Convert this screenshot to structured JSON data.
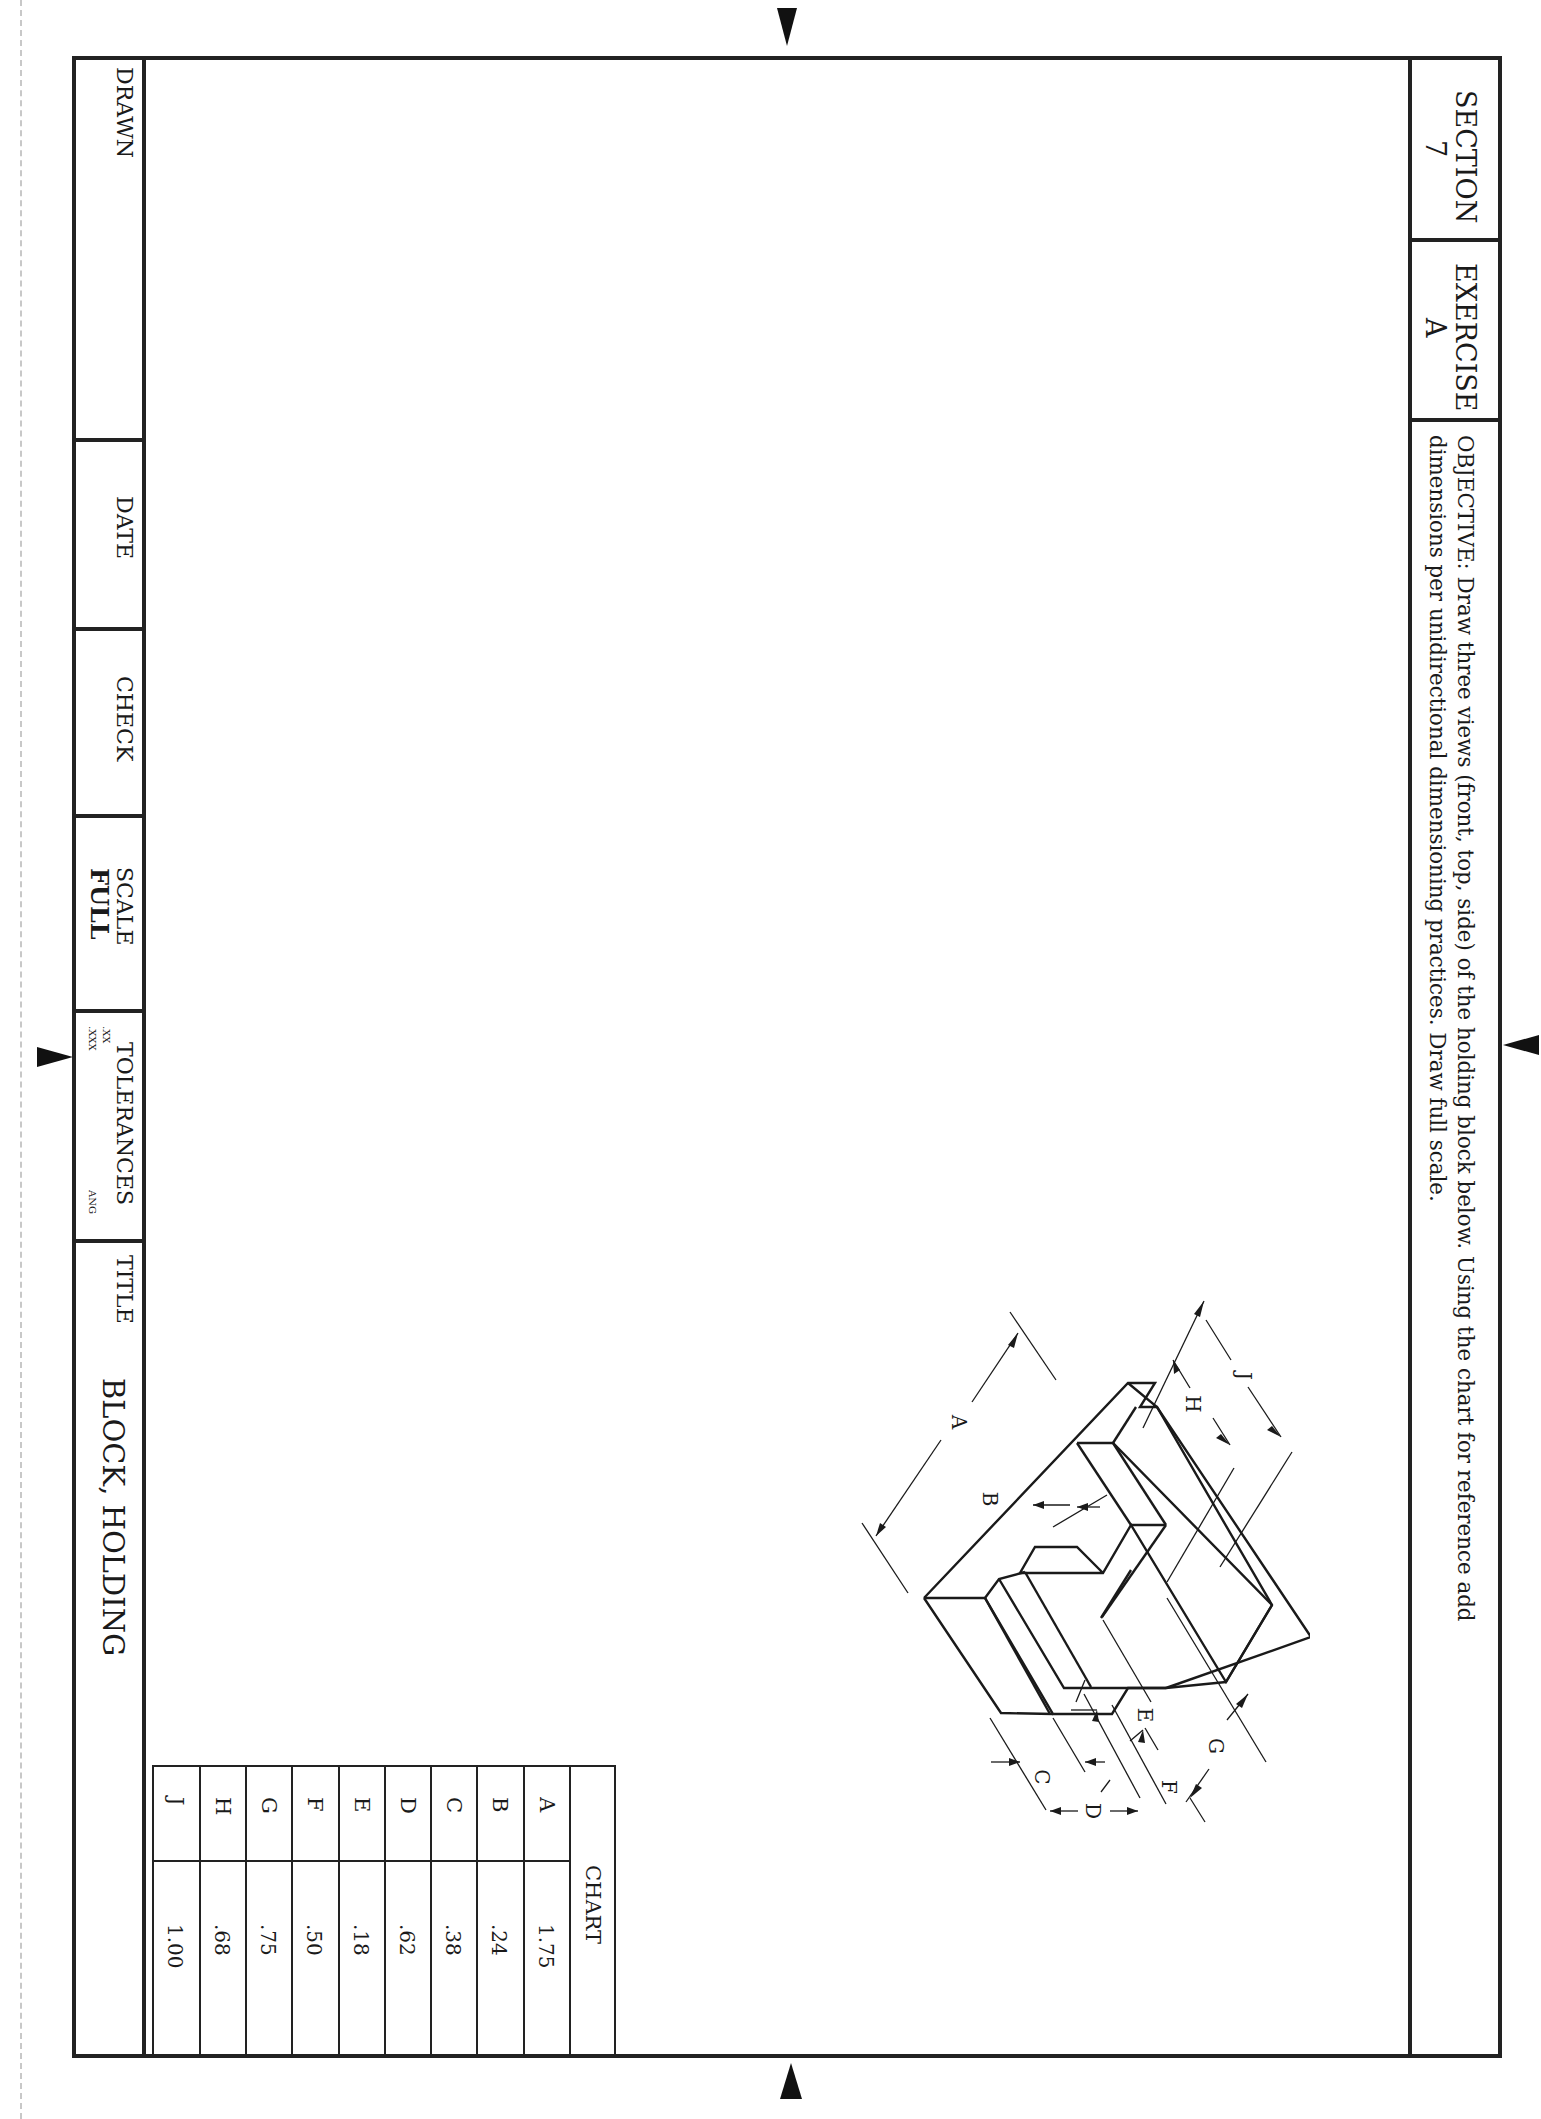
{
  "header": {
    "section_label": "SECTION",
    "section_value": "7",
    "exercise_label": "EXERCISE",
    "exercise_value": "A",
    "objective_line1": "OBJECTIVE: Draw three views (front, top, side) of the holding block below. Using the chart for reference add",
    "objective_line2": "dimensions per unidirectional dimensioning practices. Draw full scale."
  },
  "title_block": {
    "drawn_label": "DRAWN",
    "date_label": "DATE",
    "check_label": "CHECK",
    "scale_label": "SCALE",
    "scale_value": "FULL",
    "tolerances_label": "TOLERANCES",
    "tol_xx": ".XX",
    "tol_xxx": ".XXX",
    "tol_ang": "ANG",
    "title_label": "TITLE",
    "title_value": "BLOCK, HOLDING"
  },
  "chart": {
    "title": "CHART",
    "rows": [
      {
        "key": "A",
        "value": "1.75"
      },
      {
        "key": "B",
        "value": ".24"
      },
      {
        "key": "C",
        "value": ".38"
      },
      {
        "key": "D",
        "value": ".62"
      },
      {
        "key": "E",
        "value": ".18"
      },
      {
        "key": "F",
        "value": ".50"
      },
      {
        "key": "G",
        "value": ".75"
      },
      {
        "key": "H",
        "value": ".68"
      },
      {
        "key": "J",
        "value": "1.00"
      }
    ]
  },
  "drawing": {
    "dimension_labels": [
      "A",
      "B",
      "C",
      "D",
      "E",
      "F",
      "G",
      "H",
      "J"
    ]
  }
}
